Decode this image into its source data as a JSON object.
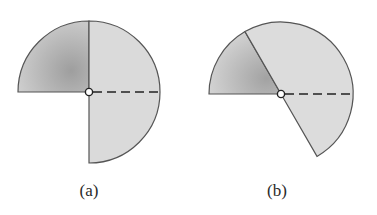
{
  "figures": [
    {
      "id": "a",
      "label": "(a)",
      "center": [
        89,
        92
      ],
      "radius": 71,
      "sector_start_deg": 180,
      "sector_end_deg": -90,
      "divider_angle_deg": 90,
      "dark_region": [
        180,
        90
      ],
      "light_region": [
        90,
        -90
      ]
    },
    {
      "id": "b",
      "label": "(b)",
      "center": [
        281,
        94
      ],
      "radius": 72,
      "sector_start_deg": 180,
      "sector_end_deg": -60,
      "divider_angle_deg": 120,
      "dark_region": [
        180,
        120
      ],
      "light_region": [
        120,
        -60
      ]
    }
  ],
  "colors": {
    "dark_fill": "#b5b5b5",
    "light_fill": "#dcdcdc",
    "stroke": "#555555",
    "dashed": "#222222"
  }
}
